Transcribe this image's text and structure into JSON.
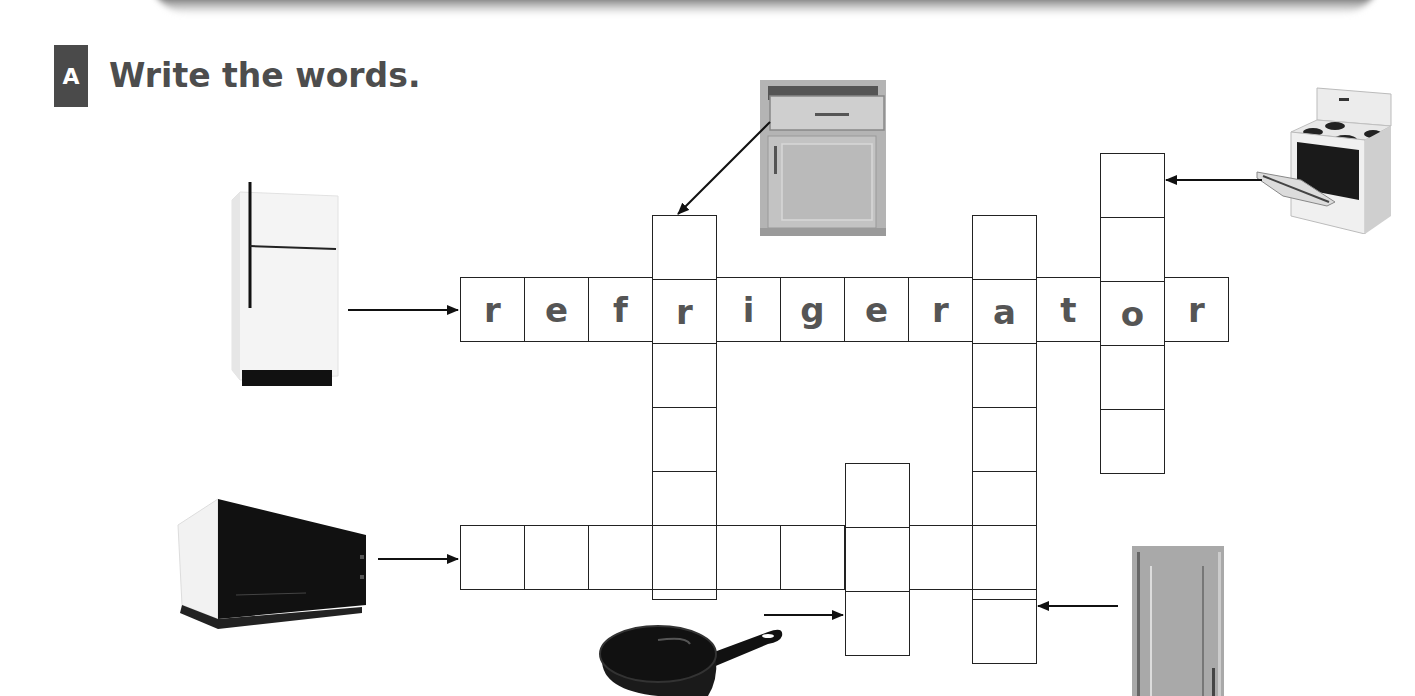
{
  "exercise": {
    "badge": "A",
    "instruction": "Write the words."
  },
  "crossword": {
    "cell_size": 64,
    "words": [
      {
        "id": "refrigerator",
        "direction": "across",
        "clue_picture": "refrigerator",
        "row_top": 277,
        "col_left": 460,
        "letters": [
          "r",
          "e",
          "f",
          "r",
          "i",
          "g",
          "e",
          "r",
          "a",
          "t",
          "o",
          "r"
        ]
      },
      {
        "id": "drawer",
        "direction": "down",
        "clue_picture": "drawer",
        "row_top": 215,
        "col_left": 652,
        "letters": [
          "",
          "r",
          "",
          "",
          "",
          ""
        ]
      },
      {
        "id": "cabinet",
        "direction": "down",
        "clue_picture": "cabinet",
        "row_top": 215,
        "col_left": 972,
        "letters": [
          "",
          "a",
          "",
          "",
          "",
          "",
          ""
        ]
      },
      {
        "id": "stove",
        "direction": "down",
        "clue_picture": "stove",
        "row_top": 153,
        "col_left": 1100,
        "letters": [
          "",
          "",
          "o",
          "",
          ""
        ]
      },
      {
        "id": "microwave",
        "direction": "across",
        "clue_picture": "microwave",
        "row_top": 525,
        "col_left": 460,
        "letters": [
          "",
          "",
          "",
          "",
          "",
          "",
          "",
          "",
          ""
        ]
      },
      {
        "id": "pan",
        "direction": "down",
        "clue_picture": "frying-pan",
        "row_top": 463,
        "col_left": 845,
        "letters": [
          "",
          "",
          ""
        ]
      }
    ]
  },
  "pictures": [
    {
      "name": "refrigerator",
      "x": 226,
      "y": 180
    },
    {
      "name": "drawer-cabinet",
      "x": 758,
      "y": 80
    },
    {
      "name": "stove",
      "x": 1255,
      "y": 84
    },
    {
      "name": "microwave",
      "x": 176,
      "y": 495
    },
    {
      "name": "frying-pan",
      "x": 598,
      "y": 620
    },
    {
      "name": "wall-cabinet",
      "x": 1132,
      "y": 546
    }
  ],
  "colors": {
    "letter": "#555555",
    "grid_line": "#222222",
    "badge_bg": "#4a4a4a",
    "title": "#4d4d4d"
  }
}
